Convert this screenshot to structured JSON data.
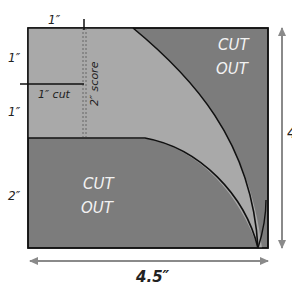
{
  "diagram": {
    "colors": {
      "light_region": "#a9a9a9",
      "dark_region": "#7c7c7c",
      "outline": "#111111",
      "arrow": "#8a8a8a",
      "cutout_text": "#f2f2f2",
      "label_text": "#222222"
    },
    "labels": {
      "top_width": "1″",
      "left_top": "1″",
      "left_mid": "1″",
      "left_bottom": "2″",
      "cut": "1″ cut",
      "score": "2″ score",
      "width_total": "4.5″",
      "height_total": "4"
    },
    "cutouts": [
      {
        "line1": "CUT",
        "line2": "OUT",
        "position": "top-right"
      },
      {
        "line1": "CUT",
        "line2": "OUT",
        "position": "bottom-left"
      }
    ]
  }
}
